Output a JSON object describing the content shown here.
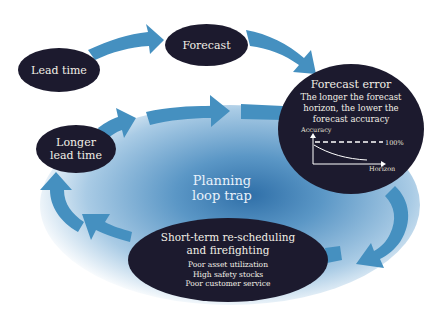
{
  "diagram": {
    "type": "cycle",
    "colors": {
      "node_fill": "#1c1a2e",
      "node_text": "#f2efe6",
      "arrow": "#4590c0",
      "center_glow": "#2f6fa8",
      "center_text": "#e8f1fa"
    },
    "center_label": {
      "line1": "Planning",
      "line2": "loop trap"
    },
    "nodes": {
      "lead_time": {
        "label": "Lead time"
      },
      "forecast": {
        "label": "Forecast"
      },
      "forecast_error": {
        "title": "Forecast error",
        "desc_line1": "The longer the forecast",
        "desc_line2": "horizon, the lower the",
        "desc_line3": "forecast accuracy",
        "mini_chart": {
          "y_label": "Accuracy",
          "x_label": "Horizon",
          "reference_label": "100%"
        }
      },
      "short_term": {
        "title_line1": "Short-term re-scheduling",
        "title_line2": "and firefighting",
        "effects": [
          "Poor asset utilization",
          "High safety stocks",
          "Poor customer service"
        ]
      },
      "longer_lead_time": {
        "line1": "Longer",
        "line2": "lead time"
      }
    },
    "flow": [
      "Lead time -> Forecast",
      "Forecast -> Forecast error",
      "Forecast error -> Short-term re-scheduling and firefighting",
      "Short-term re-scheduling and firefighting -> Longer lead time",
      "Longer lead time -> Forecast error"
    ]
  }
}
